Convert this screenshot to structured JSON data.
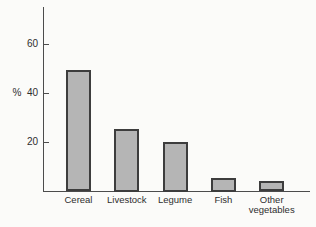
{
  "chart_data": {
    "type": "bar",
    "categories": [
      "Cereal",
      "Livestock",
      "Legume",
      "Fish",
      "Other vegetables"
    ],
    "values": [
      49,
      25,
      20,
      5,
      4
    ],
    "title": "",
    "xlabel": "",
    "ylabel": "%",
    "ylim": [
      0,
      75
    ],
    "yticks": [
      20,
      40,
      60
    ],
    "grid": false,
    "legend": "none",
    "colors": {
      "bar_fill": "#b5b5b5",
      "bar_border": "#3d3d3d",
      "axis": "#4c4c4c",
      "text": "#2e2e2e",
      "background": "#fbfbf9"
    }
  }
}
